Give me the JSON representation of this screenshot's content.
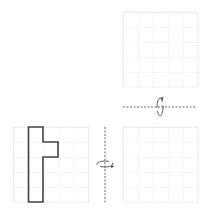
{
  "diagram": {
    "colors": {
      "background": "#ffffff",
      "grid_line": "#d9d9d9",
      "shape_outline": "#444444",
      "axis": "#555555",
      "arrow": "#555555"
    },
    "grids": [
      {
        "id": "source",
        "x": 13,
        "y": 127,
        "cols": 5,
        "rows": 5,
        "cell": 15
      },
      {
        "id": "after-vertical-flip",
        "x": 123,
        "y": 127,
        "cols": 5,
        "rows": 5,
        "cell": 15
      },
      {
        "id": "after-horizontal-flip",
        "x": 123,
        "y": 12,
        "cols": 5,
        "rows": 5,
        "cell": 15
      }
    ],
    "shape": {
      "grid": "source",
      "cells": [
        [
          1,
          0
        ],
        [
          1,
          1
        ],
        [
          1,
          2
        ],
        [
          1,
          3
        ],
        [
          1,
          4
        ],
        [
          2,
          1
        ]
      ],
      "points": "28.5,127 43,127 43,142 58,142 58,157 43,157 43,202 28.5,202"
    },
    "axes": {
      "vertical": {
        "x": 105,
        "y1": 127,
        "y2": 203,
        "rotation_icon": "rotate-around-vertical-axis"
      },
      "horizontal": {
        "y": 107,
        "x1": 123,
        "x2": 197,
        "rotation_icon": "rotate-around-horizontal-axis"
      }
    }
  }
}
